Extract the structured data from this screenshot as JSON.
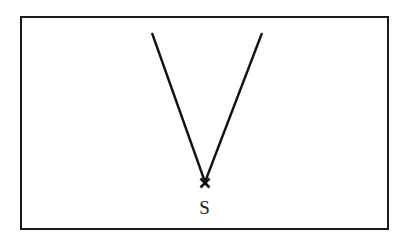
{
  "diagram": {
    "frame": {
      "x": 21,
      "y": 17,
      "width": 367,
      "height": 212,
      "stroke": "#1a1a1a",
      "stroke_width": 2
    },
    "source_point": {
      "x": 205,
      "y": 182,
      "label": "S"
    },
    "rays": [
      {
        "name": "left-ray",
        "x1": 205,
        "y1": 182,
        "x2": 152,
        "y2": 33
      },
      {
        "name": "right-ray",
        "x1": 205,
        "y1": 182,
        "x2": 262,
        "y2": 33
      }
    ],
    "line_color": "#111111"
  }
}
